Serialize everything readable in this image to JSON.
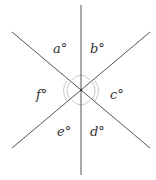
{
  "diagram": {
    "type": "intersecting-lines-angles",
    "center": [
      81,
      90
    ],
    "lines": [
      {
        "id": "vertical",
        "x1": 81,
        "y1": 5,
        "x2": 81,
        "y2": 175
      },
      {
        "id": "diag-down",
        "x1": 12,
        "y1": 32,
        "x2": 150,
        "y2": 148
      },
      {
        "id": "diag-up",
        "x1": 150,
        "y1": 32,
        "x2": 12,
        "y2": 148
      }
    ],
    "labels": [
      {
        "id": "a",
        "text": "a°",
        "x": 53,
        "y": 53
      },
      {
        "id": "b",
        "text": "b°",
        "x": 90,
        "y": 53
      },
      {
        "id": "c",
        "text": "c°",
        "x": 110,
        "y": 99
      },
      {
        "id": "d",
        "text": "d°",
        "x": 90,
        "y": 136
      },
      {
        "id": "e",
        "text": "e°",
        "x": 57,
        "y": 136
      },
      {
        "id": "f",
        "text": "f°",
        "x": 36,
        "y": 99
      }
    ],
    "colors": {
      "line": "#555555",
      "arc": "#c8c8c8",
      "label": "#333333"
    }
  }
}
